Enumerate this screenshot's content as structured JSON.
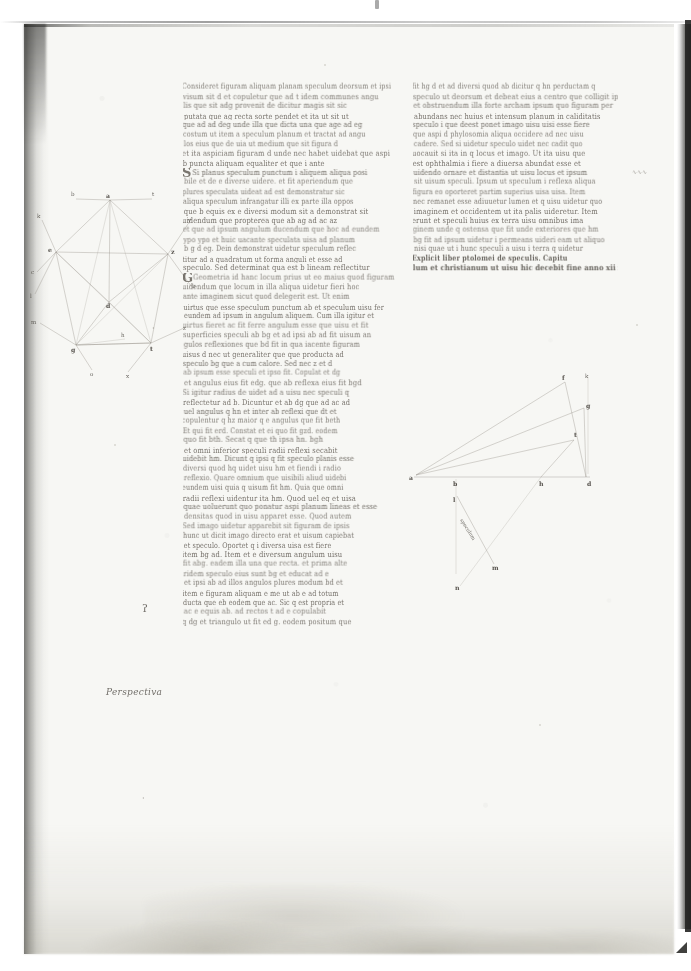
{
  "document": {
    "kind": "medieval-manuscript-folio",
    "description": "Two-column Latin scientific manuscript page (optics / perspectiva) with two geometric diagrams",
    "script": "gothic cursive",
    "ink_color": "#6b665f",
    "parchment_color": "#f7f7f4",
    "scan_background": "#ffffff",
    "edge_shadow_color": "#242422"
  },
  "left_column": {
    "name": "column-a",
    "lines": [
      "Consideret figuram aliquam planam speculum deorsum et ipsi",
      "visum sit d et copuletur que ad t idem communes angu",
      "lis que sit adg provenit de dicitur magis sit sic",
      "putata que ag recta sorte pendet et ita ut sit ut",
      "que ad ad deg unde illa que dicta una que age ad eg",
      "costum ut item a speculum planum et tractat ad angu",
      "los eius que de uia ut medium que sit figura d",
      "et ita aspiciam figuram d unde nec habet uidebat que aspi",
      "b puncta aliquam equaliter et que i ante",
      "Si planus speculum punctum i aliquem aliqua posi",
      "bile et de e diverse uidere. et fit aperiendum que",
      "plures speculata uideat ad est demonstratur sic",
      "aliqua speculum infrangatur illi ex parte illa oppos",
      "que b equis ex e diversi modum sit a demonstrat sit",
      "uidendum que propterea que ab ag ad ac az",
      "et que ad ipsum angulum ducendum que hoc ad eundem",
      "ypo ypo et huic uacante speculata uisa ad planum",
      "b g d eg. Dein demonstrat uidetur speculum reflec",
      "titur ad a quadratum ut forma anguli et esse ad",
      "speculo. Sed determinat qua est b lineam reflectitur",
      "Geometria id hanc locum prius ut eo maius quod figuram",
      "uidendum que locum in illa aliqua uidetur fieri hoc",
      "ante imaginem sicut quod delegerit est. Ut enim",
      "uirtus que esse speculum punctum ab et speculum uisu fer",
      "eundem ad ipsum in angulum aliquem. Cum illa igitur et",
      "uirtus fieret ac fit ferre angulum esse que uisu et fit",
      "superficies speculi ab bg et ad ipsi ab ad fit uisum an",
      "gulos reflexiones que bd fit in qua iacente figuram",
      "uisus d nec ut generaliter que que producta ad",
      "speculo bg que a cum calore. Sed nec z et d",
      "ab ipsum esse speculi et ipso fit. Copulat et dg",
      "et angulus eius fit edg. que ab reflexa eius fit bgd",
      "Si igitur radius de uidet ad a uisu nec speculi q",
      "reflectetur ad b. Dicuntur et ab dg que ad ac ad",
      "uel angulus q hn et inter ab reflexi que dt et",
      "copulentur q hz maior q e angulus que fit beth",
      "Et qui fit erd. Constat et ei quo fit gzd. eodem",
      "quo fit bth. Secat q que th ipsa hn. bgh",
      "et omni inferior speculi radii reflexi secabit",
      "uidebit hm. Dicunt q ipsi q fit speculo planis esse",
      "diversi quod hq uidet uisu hm et fiendi i radio",
      "reflexio. Quare omnium que uisibili aliud uidebi",
      "eundem uisi quia q uisum fit hm. Quia que omni",
      "radii reflexi uidentur ita hm. Quod uel eq et uisa",
      "quae uoluerunt quo ponatur aspi planum lineas et esse",
      "densitas quod in uisu apparet esse. Quod autem",
      "Sed imago uidetur apparebit sit figuram de ipsis",
      "hunc ut dicit imago directo erat et uisum capiebat",
      "et speculo. Oportet q i diversa uisa est fiere",
      "item bg ad. Item et e diversum angulum uisu",
      "fit abg. eadem illa una que recta. et prima alte",
      "ridem speculo eius sunt bg et educat ad e",
      "et ipsi ab ad illos angulos plures modum bd et",
      "item e figuram aliquam e me ut ab e ad totum",
      "ducta que eb eodem que ac. Sic q est propria et",
      "ac e equis ab. ad rectos t ad e copulabit",
      "q dg et triangulo ut fit ed g. eodem positum que"
    ]
  },
  "right_column": {
    "name": "column-b",
    "lines_before_colophon": [
      "fit hg d et ad diversi quod ab dicitur q hn perductam q",
      "speculo ut deorsum et debeat eius a centro que colligit ipsi bh",
      "et obstruendum illa forte archam ipsum quo figuram per",
      "abundans nec huius et intensum planum in caliditatis",
      "speculo i que deest ponet imago uisu uisi esse fiere",
      "que aspi d phylosomia aliqua occidere ad nec uisu",
      "cadere. Sed si uidetur speculo uidet nec cadit quo",
      "uocauit si ita in q locus et imago. Ut ita uisu que",
      "est ophthalmia i fiere a diuersa abundat esse et",
      "uidendo ornare et distantia ut uisu locus et ipsum",
      "sit uisum speculi. Ipsum ut speculum i reflexa aliqua",
      "figura eo oporteret partim superius uisa uisa. Item",
      "nec remanet esse adiuuetur lumen et q uisu uidetur quo",
      "imaginem et occidentem ut ita palis uideretur. Item",
      "erunt et speculi huius ex terra uisu omnibus ima",
      "ginem unde q ostensa que fit unde exteriores que hm",
      "bg fit ad ipsum uidetur i permeans uideri eam ut aliquo",
      "nisi quae ut i hunc speculi a uisu i terra q uidetur"
    ],
    "colophon": [
      "Explicit liber ptolomei de speculis. Capitu",
      "lum et christianum ut uisu hic decebit fine anno xii ix"
    ]
  },
  "left_diagram": {
    "name": "polygon-reflection-diagram",
    "vertices": [
      {
        "label": "a",
        "x": 82,
        "y": 18
      },
      {
        "label": "e",
        "x": 28,
        "y": 70
      },
      {
        "label": "z",
        "x": 140,
        "y": 72
      },
      {
        "label": "d",
        "x": 81,
        "y": 120
      },
      {
        "label": "g",
        "x": 48,
        "y": 163
      },
      {
        "label": "t",
        "x": 123,
        "y": 161
      },
      {
        "label": "h",
        "x": 97,
        "y": 157
      }
    ],
    "outer_labels": [
      {
        "label": "b",
        "x": 46,
        "y": 14
      },
      {
        "label": "t",
        "x": 122,
        "y": 14
      },
      {
        "label": "k",
        "x": 12,
        "y": 36
      },
      {
        "label": "y",
        "x": 162,
        "y": 40
      },
      {
        "label": "c",
        "x": 6,
        "y": 88
      },
      {
        "label": "b",
        "x": 166,
        "y": 103
      },
      {
        "label": "l",
        "x": 3,
        "y": 110
      },
      {
        "label": "m",
        "x": 4,
        "y": 140
      },
      {
        "label": "z",
        "x": 158,
        "y": 146
      },
      {
        "label": "o",
        "x": 62,
        "y": 190
      },
      {
        "label": "x",
        "x": 98,
        "y": 192
      }
    ]
  },
  "right_diagram": {
    "name": "ray-reflection-diagram",
    "points": [
      {
        "label": "a",
        "x": 6,
        "y": 100
      },
      {
        "label": "b",
        "x": 48,
        "y": 107
      },
      {
        "label": "h",
        "x": 133,
        "y": 108
      },
      {
        "label": "d",
        "x": 178,
        "y": 104
      },
      {
        "label": "f",
        "x": 157,
        "y": 5
      },
      {
        "label": "g",
        "x": 180,
        "y": 32
      },
      {
        "label": "t",
        "x": 168,
        "y": 65
      },
      {
        "label": "k",
        "x": 178,
        "y": 3
      },
      {
        "label": "l",
        "x": 49,
        "y": 125
      },
      {
        "label": "m",
        "x": 85,
        "y": 193
      },
      {
        "label": "n",
        "x": 50,
        "y": 210
      }
    ],
    "caption": "speculum"
  },
  "marginalia": {
    "left_margin_note": "Perspectiva",
    "left_margin_mark": "ʔ",
    "upper_tick": "‧",
    "lower_tick": "‧",
    "right_edge_note": "∿∿∿"
  }
}
